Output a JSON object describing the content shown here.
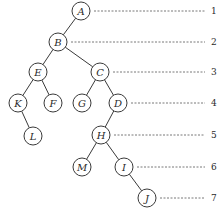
{
  "diagram": {
    "type": "binary-tree",
    "node_radius": 9,
    "nodes": [
      {
        "id": "A",
        "label": "A",
        "x": 81,
        "y": 11,
        "level": 1
      },
      {
        "id": "B",
        "label": "B",
        "x": 58,
        "y": 42,
        "level": 2
      },
      {
        "id": "E",
        "label": "E",
        "x": 38,
        "y": 72,
        "level": 3
      },
      {
        "id": "C",
        "label": "C",
        "x": 100,
        "y": 72,
        "level": 3
      },
      {
        "id": "K",
        "label": "K",
        "x": 18,
        "y": 103,
        "level": 4
      },
      {
        "id": "F",
        "label": "F",
        "x": 53,
        "y": 103,
        "level": 4
      },
      {
        "id": "G",
        "label": "G",
        "x": 82,
        "y": 103,
        "level": 4
      },
      {
        "id": "D",
        "label": "D",
        "x": 118,
        "y": 103,
        "level": 4
      },
      {
        "id": "L",
        "label": "L",
        "x": 33,
        "y": 136,
        "level": 5
      },
      {
        "id": "H",
        "label": "H",
        "x": 101,
        "y": 135,
        "level": 5
      },
      {
        "id": "M",
        "label": "M",
        "x": 82,
        "y": 167,
        "level": 6
      },
      {
        "id": "I",
        "label": "I",
        "x": 124,
        "y": 167,
        "level": 6
      },
      {
        "id": "J",
        "label": "J",
        "x": 147,
        "y": 198,
        "level": 7
      }
    ],
    "edges": [
      [
        "A",
        "B"
      ],
      [
        "B",
        "E"
      ],
      [
        "B",
        "C"
      ],
      [
        "E",
        "K"
      ],
      [
        "E",
        "F"
      ],
      [
        "C",
        "G"
      ],
      [
        "C",
        "D"
      ],
      [
        "K",
        "L"
      ],
      [
        "D",
        "H"
      ],
      [
        "H",
        "M"
      ],
      [
        "H",
        "I"
      ],
      [
        "I",
        "J"
      ]
    ],
    "levels": [
      {
        "label": "1",
        "y": 11,
        "from_node": "A"
      },
      {
        "label": "2",
        "y": 42,
        "from_node": "B"
      },
      {
        "label": "3",
        "y": 72,
        "from_node": "C"
      },
      {
        "label": "4",
        "y": 103,
        "from_node": "D"
      },
      {
        "label": "5",
        "y": 135,
        "from_node": "H"
      },
      {
        "label": "6",
        "y": 167,
        "from_node": "I"
      },
      {
        "label": "7",
        "y": 198,
        "from_node": "J"
      }
    ],
    "guide_end_x": 205,
    "label_x": 211
  }
}
